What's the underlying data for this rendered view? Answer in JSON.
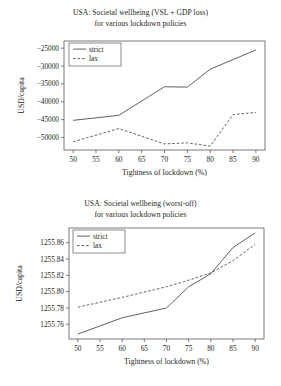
{
  "page": {
    "background": "#ffffff",
    "ink": "#231f20",
    "axis_color": "#58595b"
  },
  "figures": [
    {
      "id": "figure-top",
      "title_line1": "USA: Societal wellbeing (VSL + GDP loss)",
      "title_line2": "for various lockdown policies",
      "legend": {
        "position": "upper-left",
        "entries": [
          "strict",
          "lax"
        ]
      },
      "chart_data": {
        "type": "line",
        "title": "USA: Societal wellbeing (VSL + GDP loss) for various lockdown policies",
        "xlabel": "Tightness of lockdown (%)",
        "ylabel": "USD/capita",
        "x": [
          50,
          60,
          70,
          75,
          80,
          85,
          90
        ],
        "xticks": [
          50,
          55,
          60,
          65,
          70,
          75,
          80,
          85,
          90
        ],
        "xticklabels": [
          "50",
          "55",
          "60",
          "65",
          "70",
          "75",
          "80",
          "85",
          "90"
        ],
        "yticks": [
          -25000,
          -30000,
          -35000,
          -40000,
          -45000,
          -50000
        ],
        "yticklabels": [
          "−25000",
          "−30000",
          "−35000",
          "−40000",
          "−45000",
          "−50000"
        ],
        "xlim": [
          48,
          92
        ],
        "ylim": [
          -53500,
          -23000
        ],
        "grid": false,
        "series": [
          {
            "name": "strict",
            "style": "solid",
            "values": [
              -45200,
              -43800,
              -35800,
              -35900,
              -30900,
              -28200,
              -25500
            ]
          },
          {
            "name": "lax",
            "style": "dashed",
            "values": [
              -51200,
              -47500,
              -51800,
              -51500,
              -52400,
              -43600,
              -43000
            ]
          }
        ]
      }
    },
    {
      "id": "figure-bottom",
      "title_line1": "USA: Societal wellbeing (worst-off)",
      "title_line2": "for various lockdown policies",
      "legend": {
        "position": "upper-left",
        "entries": [
          "strict",
          "lax"
        ]
      },
      "chart_data": {
        "type": "line",
        "title": "USA: Societal wellbeing (worst-off) for various lockdown policies",
        "xlabel": "Tightness of lockdown (%)",
        "ylabel": "USD/capita",
        "x": [
          50,
          60,
          70,
          75,
          80,
          85,
          90
        ],
        "xticks": [
          50,
          55,
          60,
          65,
          70,
          75,
          80,
          85,
          90
        ],
        "xticklabels": [
          "50",
          "55",
          "60",
          "65",
          "70",
          "75",
          "80",
          "85",
          "90"
        ],
        "yticks": [
          1255.86,
          1255.84,
          1255.82,
          1255.8,
          1255.78,
          1255.76
        ],
        "yticklabels": [
          "1255.86",
          "1255.84",
          "1255.82",
          "1255.80",
          "1255.78",
          "1255.76"
        ],
        "xlim": [
          48,
          92
        ],
        "ylim": [
          1255.742,
          1255.878
        ],
        "grid": false,
        "series": [
          {
            "name": "strict",
            "style": "solid",
            "values": [
              1255.748,
              1255.768,
              1255.78,
              1255.806,
              1255.822,
              1255.854,
              1255.872
            ]
          },
          {
            "name": "lax",
            "style": "dashed",
            "values": [
              1255.781,
              1255.793,
              1255.806,
              1255.814,
              1255.823,
              1255.838,
              1255.858
            ]
          }
        ]
      }
    }
  ]
}
